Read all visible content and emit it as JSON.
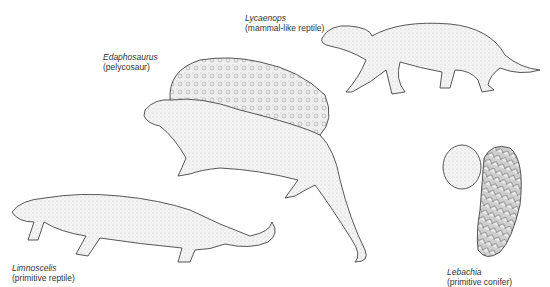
{
  "figure": {
    "specimens": [
      {
        "id": "lycaenops",
        "name": "Lycaenops",
        "description": "(mammal-like reptile)"
      },
      {
        "id": "edaphosaurus",
        "name": "Edaphosaurus",
        "description": "(pelycosaur)"
      },
      {
        "id": "limnoscelis",
        "name": "Limnoscelis",
        "description": "(primitive reptile)"
      },
      {
        "id": "lebachia",
        "name": "Lebachia",
        "description": "(primitive conifer)"
      }
    ]
  },
  "colors": {
    "ink": "#333333",
    "fill": "#f2f2f2",
    "shade": "#d6d6d6",
    "background": "#ffffff"
  }
}
